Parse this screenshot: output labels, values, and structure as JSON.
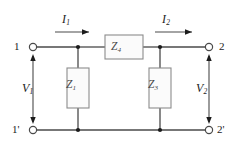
{
  "figure": {
    "kind": "circuit-schematic",
    "width": 238,
    "height": 148,
    "background": "#ffffff",
    "wire_color": "#4a4a4a",
    "text_color": "#1c1c1c",
    "component_stroke": "#8c8c8c",
    "component_fill": "#fbfbfb"
  },
  "terminals": {
    "top_left": "1",
    "bottom_left": "1'",
    "top_right": "2",
    "bottom_right": "2'"
  },
  "currents": {
    "input": {
      "symbol": "I",
      "subscript": "1"
    },
    "output": {
      "symbol": "I",
      "subscript": "2"
    }
  },
  "voltages": {
    "input": {
      "symbol": "V",
      "subscript": "1"
    },
    "output": {
      "symbol": "V",
      "subscript": "2"
    }
  },
  "components": [
    {
      "id": "z-series",
      "symbol": "Z",
      "subscript": "4",
      "orientation": "horizontal",
      "role": "series-branch"
    },
    {
      "id": "z-shunt-left",
      "symbol": "Z",
      "subscript": "1",
      "orientation": "vertical",
      "role": "shunt-branch"
    },
    {
      "id": "z-shunt-right",
      "symbol": "Z",
      "subscript": "3",
      "orientation": "vertical",
      "role": "shunt-branch"
    }
  ],
  "geometry": {
    "top_rail_y": 47,
    "bottom_rail_y": 130,
    "left_terminal_x": 33,
    "right_terminal_x": 209,
    "node_left_x": 78,
    "node_right_x": 160
  }
}
